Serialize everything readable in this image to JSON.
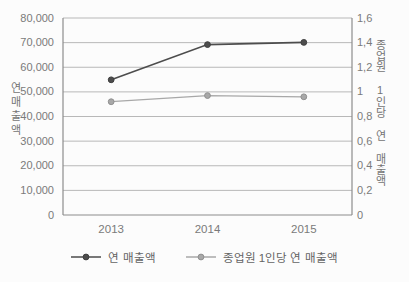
{
  "chart_data": {
    "type": "line",
    "categories": [
      "2013",
      "2014",
      "2015"
    ],
    "series": [
      {
        "name": "연 매출액",
        "axis": "left",
        "color": "#4d4d4d",
        "marker_color": "#3f3f3f",
        "values": [
          54900,
          69200,
          70100
        ]
      },
      {
        "name": "종업원 1인당 연 매출액",
        "axis": "right",
        "color": "#a8a8a8",
        "marker_color": "#909090",
        "values": [
          0.92,
          0.97,
          0.96
        ]
      }
    ],
    "left_axis": {
      "title": "연매출액",
      "min": 0,
      "max": 80000,
      "step": 10000,
      "tick_labels": [
        "0",
        "10,000",
        "20,000",
        "30,000",
        "40,000",
        "50,000",
        "60,000",
        "70,000",
        "80,000"
      ]
    },
    "right_axis": {
      "title": "종업원 1인당 연 매출액",
      "min": 0,
      "max": 1.6,
      "step": 0.2,
      "tick_labels": [
        "0",
        "0,2",
        "0,4",
        "0,6",
        "0,8",
        "1",
        "1,2",
        "1,4",
        "1,6"
      ]
    },
    "grid": true,
    "legend_position": "bottom",
    "colors": {
      "gridline": "#b8b8b8",
      "axis_line": "#8c8c8c",
      "background": "#fcfcfc"
    }
  }
}
